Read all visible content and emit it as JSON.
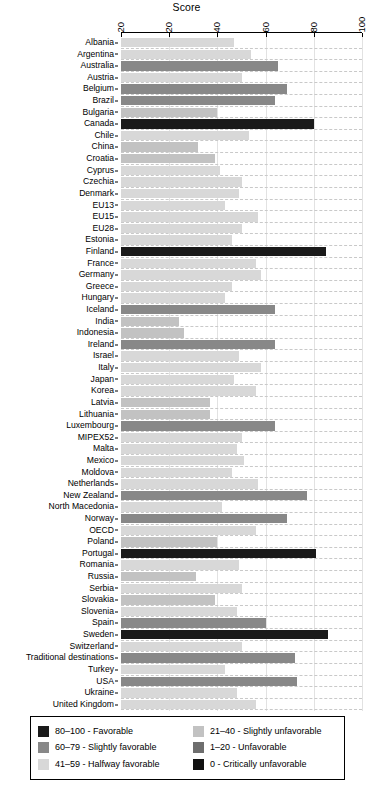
{
  "chart_data": {
    "type": "bar",
    "orientation": "horizontal",
    "title": "Score",
    "xlabel": "Score",
    "ylabel": "",
    "xlim": [
      0,
      100
    ],
    "xticks": [
      0,
      20,
      40,
      60,
      80,
      100
    ],
    "xtick_labels": [
      "20",
      "20",
      "40",
      "60",
      "80",
      "100"
    ],
    "grid": "horizontal dashed + vertical light",
    "legend_position": "bottom",
    "categories": [
      "Albania",
      "Argentina",
      "Australia",
      "Austria",
      "Belgium",
      "Brazil",
      "Bulgaria",
      "Canada",
      "Chile",
      "China",
      "Croatia",
      "Cyprus",
      "Czechia",
      "Denmark",
      "EU13",
      "EU15",
      "EU28",
      "Estonia",
      "Finland",
      "France",
      "Germany",
      "Greece",
      "Hungary",
      "Iceland",
      "India",
      "Indonesia",
      "Ireland",
      "Israel",
      "Italy",
      "Japan",
      "Korea",
      "Latvia",
      "Lithuania",
      "Luxembourg",
      "MIPEX52",
      "Malta",
      "Mexico",
      "Moldova",
      "Netherlands",
      "New Zealand",
      "North Macedonia",
      "Norway",
      "OECD",
      "Poland",
      "Portugal",
      "Romania",
      "Russia",
      "Serbia",
      "Slovakia",
      "Slovenia",
      "Spain",
      "Sweden",
      "Switzerland",
      "Traditional destinations",
      "Turkey",
      "USA",
      "Ukraine",
      "United Kingdom"
    ],
    "values": [
      47,
      54,
      65,
      50,
      69,
      64,
      40,
      80,
      53,
      32,
      39,
      41,
      50,
      49,
      43,
      57,
      50,
      46,
      85,
      56,
      58,
      46,
      43,
      64,
      24,
      26,
      64,
      49,
      58,
      47,
      56,
      37,
      37,
      64,
      50,
      48,
      51,
      46,
      57,
      77,
      42,
      69,
      56,
      40,
      81,
      49,
      31,
      50,
      39,
      48,
      60,
      86,
      50,
      72,
      43,
      73,
      48,
      56
    ],
    "bands": [
      {
        "label": "80–100 - Favorable",
        "min": 80,
        "max": 100,
        "color": "#1a1a1a"
      },
      {
        "label": "60–79 - Slightly favorable",
        "min": 60,
        "max": 79,
        "color": "#888888"
      },
      {
        "label": "41–59 - Halfway favorable",
        "min": 41,
        "max": 59,
        "color": "#d8d8d8"
      },
      {
        "label": "21–40 - Slightly unfavorable",
        "min": 21,
        "max": 40,
        "color": "#c2c2c2"
      },
      {
        "label": "1–20 - Unfavorable",
        "min": 1,
        "max": 20,
        "color": "#6e6e6e"
      },
      {
        "label": "0 - Critically unfavorable",
        "min": 0,
        "max": 0,
        "color": "#111111"
      }
    ]
  },
  "legend": {
    "left_items": [
      "80–100 - Favorable",
      "60–79 - Slightly favorable",
      "41–59 - Halfway favorable"
    ],
    "right_items": [
      "21–40 - Slightly unfavorable",
      "1–20 - Unfavorable",
      "0 - Critically unfavorable"
    ],
    "left_colors": [
      "#1a1a1a",
      "#888888",
      "#d8d8d8"
    ],
    "right_colors": [
      "#c2c2c2",
      "#6e6e6e",
      "#111111"
    ]
  }
}
